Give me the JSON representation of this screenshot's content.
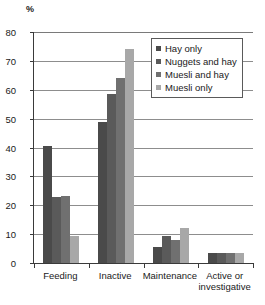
{
  "chart_data": {
    "type": "bar",
    "title": "",
    "xlabel": "",
    "ylabel": "%",
    "ylim": [
      0,
      80
    ],
    "yticks": [
      0,
      10,
      20,
      30,
      40,
      50,
      60,
      70,
      80
    ],
    "grid": true,
    "legend_position": "upper right",
    "categories": [
      "Feeding",
      "Inactive",
      "Maintenance",
      "Active or\ninvestigative"
    ],
    "series": [
      {
        "name": "Hay only",
        "color": "#4a4a4a",
        "values": [
          40.5,
          49.0,
          5.5,
          3.6
        ]
      },
      {
        "name": "Nuggets and hay",
        "color": "#5a5a5a",
        "values": [
          23.0,
          58.5,
          9.5,
          3.6
        ]
      },
      {
        "name": "Muesli and hay",
        "color": "#707070",
        "values": [
          23.2,
          64.0,
          8.0,
          3.5
        ]
      },
      {
        "name": "Muesli only",
        "color": "#a8a8a8",
        "values": [
          9.2,
          74.2,
          12.0,
          3.5
        ]
      }
    ]
  },
  "axis": {
    "unit_label": "%",
    "tick_labels": [
      "80",
      "70",
      "60",
      "50",
      "40",
      "30",
      "20",
      "10",
      "0"
    ]
  },
  "legend": {
    "items": [
      {
        "label": "Hay only"
      },
      {
        "label": "Nuggets and hay"
      },
      {
        "label": "Muesli and hay"
      },
      {
        "label": "Muesli only"
      }
    ]
  }
}
